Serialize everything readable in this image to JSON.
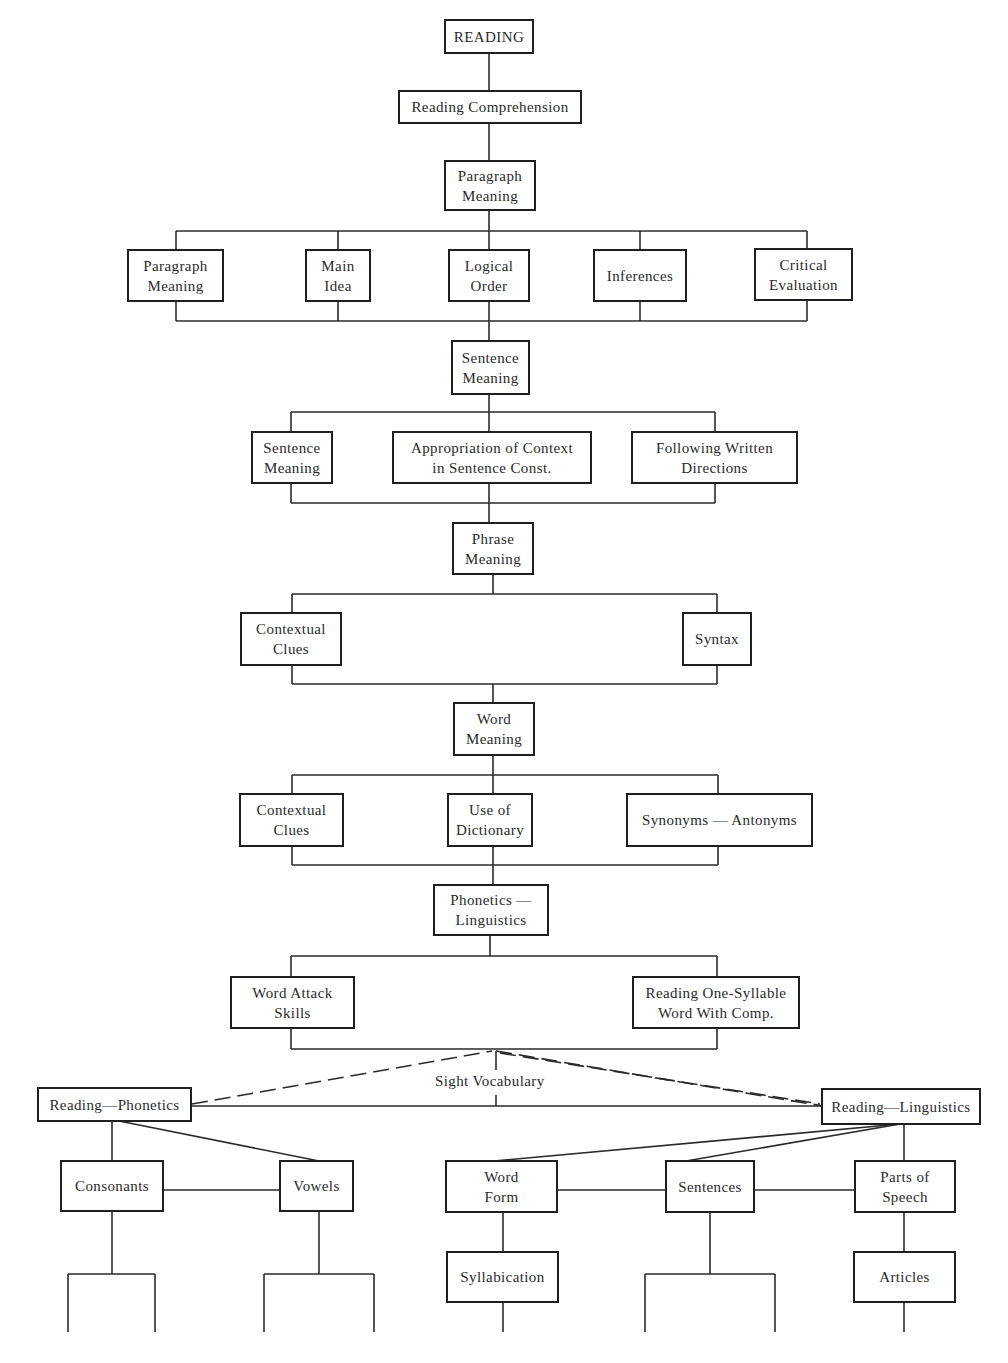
{
  "diagram": {
    "title": "READING",
    "nodes": {
      "reading": "READING",
      "reading_comprehension": "Reading Comprehension",
      "paragraph_meaning_main": "Paragraph\nMeaning",
      "paragraph_children": [
        "Paragraph\nMeaning",
        "Main\nIdea",
        "Logical\nOrder",
        "Inferences",
        "Critical\nEvaluation"
      ],
      "sentence_meaning_main": "Sentence\nMeaning",
      "sentence_children": [
        "Sentence\nMeaning",
        "Appropriation of Context\nin Sentence Const.",
        "Following Written\nDirections"
      ],
      "phrase_meaning_main": "Phrase\nMeaning",
      "phrase_children": [
        "Contextual\nClues",
        "Syntax"
      ],
      "word_meaning_main": "Word\nMeaning",
      "word_children": [
        "Contextual\nClues",
        "Use of\nDictionary",
        "Synonyms — Antonyms"
      ],
      "phonetics_linguistics": "Phonetics —\nLinguistics",
      "phonetics_children": [
        "Word Attack\nSkills",
        "Reading One-Syllable\nWord With Comp."
      ],
      "sight_vocabulary": "Sight Vocabulary",
      "reading_phonetics": "Reading—Phonetics",
      "reading_linguistics": "Reading—Linguistics",
      "phonetics_branch": [
        "Consonants",
        "Vowels"
      ],
      "linguistics_branch": [
        "Word\nForm",
        "Sentences",
        "Parts of\nSpeech"
      ],
      "linguistics_sub": [
        "Syllabication",
        "Articles"
      ]
    },
    "colors": {
      "line": "#2a2a2a",
      "box_border": "#1f1f1f",
      "background": "#ffffff"
    }
  }
}
